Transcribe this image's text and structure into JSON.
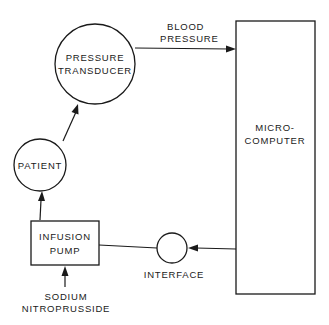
{
  "diagram": {
    "type": "block-flow",
    "nodes": {
      "pressure_transducer": {
        "line1": "PRESSURE",
        "line2": "TRANSDUCER",
        "shape": "circle"
      },
      "patient": {
        "label": "PATIENT",
        "shape": "circle"
      },
      "infusion_pump": {
        "line1": "INFUSION",
        "line2": "PUMP",
        "shape": "rectangle"
      },
      "microcomputer": {
        "line1": "MICRO-",
        "line2": "COMPUTER",
        "shape": "rectangle"
      },
      "interface": {
        "label": "INTERFACE",
        "shape": "circle"
      }
    },
    "edges": {
      "blood_pressure": {
        "line1": "BLOOD",
        "line2": "PRESSURE",
        "from": "pressure_transducer",
        "to": "microcomputer"
      },
      "patient_to_transducer": {
        "from": "patient",
        "to": "pressure_transducer"
      },
      "pump_to_patient": {
        "from": "infusion_pump",
        "to": "patient"
      },
      "computer_to_interface": {
        "from": "microcomputer",
        "to": "interface"
      },
      "interface_to_pump": {
        "from": "interface",
        "to": "infusion_pump"
      }
    },
    "input": {
      "line1": "SODIUM",
      "line2": "NITROPRUSSIDE",
      "to": "infusion_pump"
    }
  }
}
